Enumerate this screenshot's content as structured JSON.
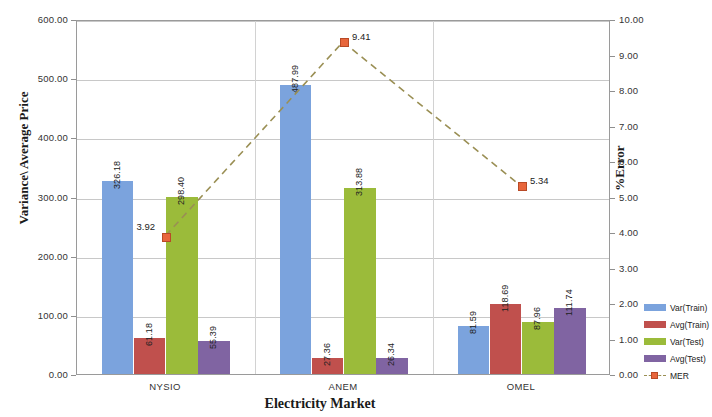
{
  "chart_data": {
    "type": "bar",
    "title": "",
    "xlabel": "Electricity Market",
    "ylabel": "Variance\\ Average Price",
    "y2label": "%Error",
    "categories": [
      "NYSIO",
      "ANEM",
      "OMEL"
    ],
    "ylim": [
      0,
      600
    ],
    "y2lim": [
      0,
      10
    ],
    "yticks": [
      "0.00",
      "100.00",
      "200.00",
      "300.00",
      "400.00",
      "500.00",
      "600.00"
    ],
    "y2ticks": [
      "0.00",
      "1.00",
      "2.00",
      "3.00",
      "4.00",
      "5.00",
      "6.00",
      "7.00",
      "8.00",
      "9.00",
      "10.00"
    ],
    "grid": true,
    "legend_position": "right",
    "series": [
      {
        "name": "Var(Train)",
        "type": "bar",
        "axis": "left",
        "color": "#7ba3dd",
        "values": [
          326.18,
          487.99,
          81.59
        ],
        "labels": [
          "326.18",
          "487.99",
          "81.59"
        ]
      },
      {
        "name": "Avg(Train)",
        "type": "bar",
        "axis": "left",
        "color": "#c0504d",
        "values": [
          61.18,
          27.36,
          118.69
        ],
        "labels": [
          "61.18",
          "27.36",
          "118.69"
        ]
      },
      {
        "name": "Var(Test)",
        "type": "bar",
        "axis": "left",
        "color": "#9bbb3a",
        "values": [
          298.4,
          313.88,
          87.96
        ],
        "labels": [
          "298.40",
          "313.88",
          "87.96"
        ]
      },
      {
        "name": "Avg(Test)",
        "type": "bar",
        "axis": "left",
        "color": "#8064a2",
        "values": [
          55.39,
          26.34,
          111.74
        ],
        "labels": [
          "55.39",
          "26.34",
          "111.74"
        ]
      },
      {
        "name": "MER",
        "type": "line",
        "axis": "right",
        "color": "#e8663c",
        "line_color": "#9a8f54",
        "line_style": "dashed",
        "values": [
          3.92,
          9.41,
          5.34
        ],
        "labels": [
          "3.92",
          "9.41",
          "5.34"
        ]
      }
    ]
  },
  "legend": {
    "items": [
      {
        "label": "Var(Train)",
        "color": "#7ba3dd"
      },
      {
        "label": "Avg(Train)",
        "color": "#c0504d"
      },
      {
        "label": "Var(Test)",
        "color": "#9bbb3a"
      },
      {
        "label": "Avg(Test)",
        "color": "#8064a2"
      },
      {
        "label": "MER",
        "color": "#e8663c"
      }
    ]
  }
}
